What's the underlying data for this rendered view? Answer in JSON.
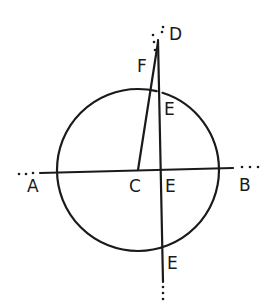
{
  "diagram": {
    "type": "geometry-construction",
    "stroke_color": "#1a1a1a",
    "background": "#ffffff",
    "circle": {
      "center": "C",
      "cx": 138,
      "cy": 170,
      "r": 81
    },
    "points": {
      "A": {
        "label": "A",
        "x": 33,
        "y": 192
      },
      "B": {
        "label": "B",
        "x": 244,
        "y": 190
      },
      "C": {
        "label": "C",
        "x": 131,
        "y": 192
      },
      "D": {
        "label": "D",
        "x": 165,
        "y": 37
      },
      "F": {
        "label": "F",
        "x": 138,
        "y": 66
      },
      "E_top": {
        "label": "E",
        "x": 162,
        "y": 113
      },
      "E_mid": {
        "label": "E",
        "x": 165,
        "y": 192
      },
      "E_bottom": {
        "label": "E",
        "x": 167,
        "y": 268
      }
    },
    "lines": [
      {
        "name": "line-AB",
        "from": "A",
        "to": "B",
        "dotted_ends": true
      },
      {
        "name": "line-CF",
        "from": "C",
        "to": "F"
      },
      {
        "name": "line-DE",
        "from": "D",
        "to": "E_bottom",
        "dotted_ends": true
      }
    ]
  }
}
